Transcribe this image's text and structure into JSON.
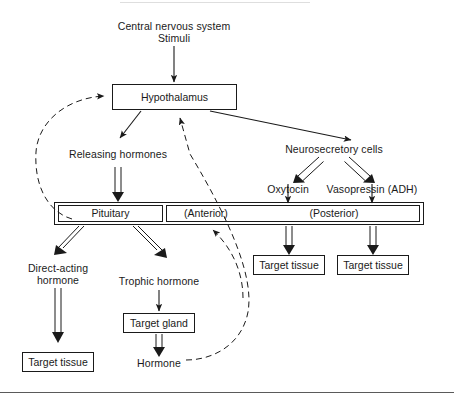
{
  "figure": {
    "background_color": "#ffffff",
    "line_color": "#1a1a1a",
    "rule_color": "#5a5a5a"
  },
  "nodes": {
    "cns_line1": "Central nervous system",
    "cns_line2": "Stimuli",
    "hypothalamus": "Hypothalamus",
    "releasing_hormones": "Releasing hormones",
    "neurosecretory_cells": "Neurosecretory cells",
    "oxytocin": "Oxytocin",
    "vasopressin": "Vasopressin (ADH)",
    "pituitary": "Pituitary",
    "anterior": "(Anterior)",
    "posterior": "(Posterior)",
    "target_tissue_oxytocin": "Target tissue",
    "target_tissue_vasopressin": "Target tissue",
    "direct_acting_line1": "Direct-acting",
    "direct_acting_line2": "hormone",
    "trophic_hormone": "Trophic hormone",
    "target_tissue_direct": "Target tissue",
    "target_gland": "Target gland",
    "hormone": "Hormone"
  },
  "edges": [
    {
      "name": "cns-to-hypothalamus",
      "style": "solid-arrow",
      "from": "cns",
      "to": "hypothalamus"
    },
    {
      "name": "hypothalamus-to-releasing-hormones",
      "style": "solid-arrow",
      "from": "hypothalamus",
      "to": "releasing_hormones"
    },
    {
      "name": "hypothalamus-to-neurosecretory-cells",
      "style": "solid-arrow",
      "from": "hypothalamus",
      "to": "neurosecretory_cells"
    },
    {
      "name": "neurosecretory-to-oxytocin",
      "style": "open-double-arrow",
      "from": "neurosecretory_cells",
      "to": "oxytocin"
    },
    {
      "name": "neurosecretory-to-vasopressin",
      "style": "open-double-arrow",
      "from": "neurosecretory_cells",
      "to": "vasopressin"
    },
    {
      "name": "releasing-hormones-to-pituitary",
      "style": "open-double-arrow",
      "from": "releasing_hormones",
      "to": "pituitary"
    },
    {
      "name": "oxytocin-to-posterior",
      "style": "solid-arrow",
      "from": "oxytocin",
      "to": "posterior"
    },
    {
      "name": "vasopressin-to-posterior",
      "style": "solid-arrow",
      "from": "vasopressin",
      "to": "posterior"
    },
    {
      "name": "posterior-to-target-tissue-1",
      "style": "open-double-arrow",
      "from": "posterior",
      "to": "target_tissue_oxytocin"
    },
    {
      "name": "posterior-to-target-tissue-2",
      "style": "open-double-arrow",
      "from": "posterior",
      "to": "target_tissue_vasopressin"
    },
    {
      "name": "pituitary-to-direct-acting-hormone",
      "style": "open-double-arrow",
      "from": "pituitary",
      "to": "direct_acting"
    },
    {
      "name": "pituitary-to-trophic-hormone",
      "style": "open-double-arrow",
      "from": "pituitary",
      "to": "trophic_hormone"
    },
    {
      "name": "direct-acting-to-target-tissue",
      "style": "open-double-arrow",
      "from": "direct_acting",
      "to": "target_tissue_direct"
    },
    {
      "name": "trophic-hormone-to-target-gland",
      "style": "solid-arrow",
      "from": "trophic_hormone",
      "to": "target_gland"
    },
    {
      "name": "target-gland-to-hormone",
      "style": "open-double-arrow",
      "from": "target_gland",
      "to": "hormone"
    },
    {
      "name": "feedback-pituitary-to-hypothalamus",
      "style": "dashed-arrow",
      "from": "pituitary",
      "to": "hypothalamus"
    },
    {
      "name": "feedback-hormone-to-hypothalamus",
      "style": "dashed-arrow",
      "from": "hormone",
      "to": "hypothalamus"
    },
    {
      "name": "feedback-hormone-to-anterior",
      "style": "dashed-arrow",
      "from": "hormone",
      "to": "anterior"
    }
  ]
}
